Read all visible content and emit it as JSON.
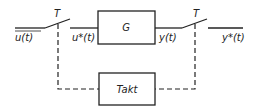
{
  "diagram": {
    "title": "",
    "blocks": [
      {
        "id": "G",
        "label": "G"
      },
      {
        "id": "Takt",
        "label": "Takt"
      }
    ],
    "switches": [
      {
        "id": "input-sampler",
        "label": "T"
      },
      {
        "id": "output-sampler",
        "label": "T"
      }
    ],
    "signals": {
      "input": "u(t)",
      "sampled_input": "u*(t)",
      "output": "y(t)",
      "sampled_output": "y*(t)"
    },
    "colors": {
      "stroke": "#222222",
      "background": "#ffffff"
    }
  }
}
